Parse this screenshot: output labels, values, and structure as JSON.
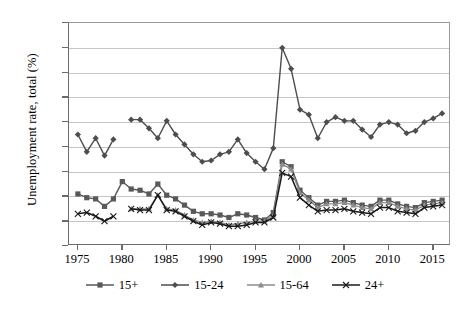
{
  "chart_data": {
    "type": "line",
    "title": "",
    "xlabel": "",
    "ylabel": "Unemployment rate, total (%)",
    "xlim": [
      1974,
      2017
    ],
    "ylim": [
      0,
      18
    ],
    "ytick_step": 2,
    "grid": true,
    "legend_position": "bottom",
    "ytick_labels": [
      "0",
      "2",
      "4",
      "6",
      "8",
      "10",
      "12",
      "14",
      "16",
      "18"
    ],
    "xtick_labels": [
      "1975",
      "1980",
      "1985",
      "1990",
      "1995",
      "2000",
      "2005",
      "2010",
      "2015"
    ],
    "xticks": [
      1975,
      1980,
      1985,
      1990,
      1995,
      2000,
      2005,
      2010,
      2015
    ],
    "series": [
      {
        "name": "15+",
        "marker": "square",
        "color": "#595959",
        "points": [
          {
            "x": 1975,
            "y": 4.2
          },
          {
            "x": 1976,
            "y": 3.9
          },
          {
            "x": 1977,
            "y": 3.8
          },
          {
            "x": 1978,
            "y": 3.2
          },
          {
            "x": 1979,
            "y": 3.8
          },
          {
            "x": 1980,
            "y": 5.2
          },
          {
            "x": 1981,
            "y": 4.6
          },
          {
            "x": 1982,
            "y": 4.5
          },
          {
            "x": 1983,
            "y": 4.2
          },
          {
            "x": 1984,
            "y": 5.0
          },
          {
            "x": 1985,
            "y": 4.1
          },
          {
            "x": 1986,
            "y": 3.8
          },
          {
            "x": 1987,
            "y": 3.3
          },
          {
            "x": 1988,
            "y": 2.8
          },
          {
            "x": 1989,
            "y": 2.6
          },
          {
            "x": 1990,
            "y": 2.6
          },
          {
            "x": 1991,
            "y": 2.5
          },
          {
            "x": 1992,
            "y": 2.3
          },
          {
            "x": 1993,
            "y": 2.6
          },
          {
            "x": 1994,
            "y": 2.5
          },
          {
            "x": 1995,
            "y": 2.3
          },
          {
            "x": 1996,
            "y": 2.1
          },
          {
            "x": 1997,
            "y": 2.7
          },
          {
            "x": 1998,
            "y": 6.8
          },
          {
            "x": 1999,
            "y": 6.4
          },
          {
            "x": 2000,
            "y": 4.5
          },
          {
            "x": 2001,
            "y": 3.9
          },
          {
            "x": 2002,
            "y": 3.3
          },
          {
            "x": 2003,
            "y": 3.6
          },
          {
            "x": 2004,
            "y": 3.6
          },
          {
            "x": 2005,
            "y": 3.7
          },
          {
            "x": 2006,
            "y": 3.5
          },
          {
            "x": 2007,
            "y": 3.3
          },
          {
            "x": 2008,
            "y": 3.2
          },
          {
            "x": 2009,
            "y": 3.7
          },
          {
            "x": 2010,
            "y": 3.7
          },
          {
            "x": 2011,
            "y": 3.4
          },
          {
            "x": 2012,
            "y": 3.2
          },
          {
            "x": 2013,
            "y": 3.1
          },
          {
            "x": 2014,
            "y": 3.5
          },
          {
            "x": 2015,
            "y": 3.6
          },
          {
            "x": 2016,
            "y": 3.7
          }
        ]
      },
      {
        "name": "15-24",
        "marker": "diamond",
        "color": "#4d4d4d",
        "points": [
          {
            "x": 1975,
            "y": 9.0
          },
          {
            "x": 1976,
            "y": 7.6
          },
          {
            "x": 1977,
            "y": 8.7
          },
          {
            "x": 1978,
            "y": 7.3
          },
          {
            "x": 1979,
            "y": 8.6
          },
          {
            "x": 1981,
            "y": 10.2
          },
          {
            "x": 1982,
            "y": 10.2
          },
          {
            "x": 1983,
            "y": 9.5
          },
          {
            "x": 1984,
            "y": 8.7
          },
          {
            "x": 1985,
            "y": 10.1
          },
          {
            "x": 1986,
            "y": 9.0
          },
          {
            "x": 1987,
            "y": 8.2
          },
          {
            "x": 1988,
            "y": 7.4
          },
          {
            "x": 1989,
            "y": 6.8
          },
          {
            "x": 1990,
            "y": 6.9
          },
          {
            "x": 1991,
            "y": 7.4
          },
          {
            "x": 1992,
            "y": 7.6
          },
          {
            "x": 1993,
            "y": 8.6
          },
          {
            "x": 1994,
            "y": 7.5
          },
          {
            "x": 1995,
            "y": 6.8
          },
          {
            "x": 1996,
            "y": 6.2
          },
          {
            "x": 1997,
            "y": 7.9
          },
          {
            "x": 1998,
            "y": 16.0
          },
          {
            "x": 1999,
            "y": 14.3
          },
          {
            "x": 2000,
            "y": 11.0
          },
          {
            "x": 2001,
            "y": 10.6
          },
          {
            "x": 2002,
            "y": 8.7
          },
          {
            "x": 2003,
            "y": 10.0
          },
          {
            "x": 2004,
            "y": 10.4
          },
          {
            "x": 2005,
            "y": 10.1
          },
          {
            "x": 2006,
            "y": 10.1
          },
          {
            "x": 2007,
            "y": 9.4
          },
          {
            "x": 2008,
            "y": 8.8
          },
          {
            "x": 2009,
            "y": 9.8
          },
          {
            "x": 2010,
            "y": 10.0
          },
          {
            "x": 2011,
            "y": 9.8
          },
          {
            "x": 2012,
            "y": 9.1
          },
          {
            "x": 2013,
            "y": 9.3
          },
          {
            "x": 2014,
            "y": 10.0
          },
          {
            "x": 2015,
            "y": 10.3
          },
          {
            "x": 2016,
            "y": 10.7
          }
        ]
      },
      {
        "name": "15-64",
        "marker": "triangle",
        "color": "#8c8c8c",
        "points": [
          {
            "x": 1981,
            "y": 3.0
          },
          {
            "x": 1982,
            "y": 3.0
          },
          {
            "x": 1983,
            "y": 3.0
          },
          {
            "x": 1984,
            "y": 4.1
          },
          {
            "x": 1985,
            "y": 3.0
          },
          {
            "x": 1986,
            "y": 2.9
          },
          {
            "x": 1987,
            "y": 2.5
          },
          {
            "x": 1988,
            "y": 2.1
          },
          {
            "x": 1989,
            "y": 1.9
          },
          {
            "x": 1990,
            "y": 2.0
          },
          {
            "x": 1991,
            "y": 1.9
          },
          {
            "x": 1992,
            "y": 1.7
          },
          {
            "x": 1993,
            "y": 1.8
          },
          {
            "x": 1994,
            "y": 1.9
          },
          {
            "x": 1995,
            "y": 2.0
          },
          {
            "x": 1996,
            "y": 2.0
          },
          {
            "x": 1997,
            "y": 2.5
          },
          {
            "x": 1998,
            "y": 6.6
          },
          {
            "x": 1999,
            "y": 6.2
          },
          {
            "x": 2000,
            "y": 4.3
          },
          {
            "x": 2001,
            "y": 3.7
          },
          {
            "x": 2002,
            "y": 3.1
          },
          {
            "x": 2003,
            "y": 3.4
          },
          {
            "x": 2004,
            "y": 3.4
          },
          {
            "x": 2005,
            "y": 3.5
          },
          {
            "x": 2006,
            "y": 3.3
          },
          {
            "x": 2007,
            "y": 3.1
          },
          {
            "x": 2008,
            "y": 3.0
          },
          {
            "x": 2009,
            "y": 3.5
          },
          {
            "x": 2010,
            "y": 3.5
          },
          {
            "x": 2011,
            "y": 3.2
          },
          {
            "x": 2012,
            "y": 3.0
          },
          {
            "x": 2013,
            "y": 2.9
          },
          {
            "x": 2014,
            "y": 3.3
          },
          {
            "x": 2015,
            "y": 3.4
          },
          {
            "x": 2016,
            "y": 3.5
          }
        ]
      },
      {
        "name": "24+",
        "marker": "cross",
        "color": "#1a1a1a",
        "points": [
          {
            "x": 1975,
            "y": 2.6
          },
          {
            "x": 1976,
            "y": 2.7
          },
          {
            "x": 1977,
            "y": 2.4
          },
          {
            "x": 1978,
            "y": 2.0
          },
          {
            "x": 1979,
            "y": 2.4
          },
          {
            "x": 1981,
            "y": 3.0
          },
          {
            "x": 1982,
            "y": 2.9
          },
          {
            "x": 1983,
            "y": 2.9
          },
          {
            "x": 1984,
            "y": 4.1
          },
          {
            "x": 1985,
            "y": 2.9
          },
          {
            "x": 1986,
            "y": 2.8
          },
          {
            "x": 1987,
            "y": 2.4
          },
          {
            "x": 1988,
            "y": 2.0
          },
          {
            "x": 1989,
            "y": 1.7
          },
          {
            "x": 1990,
            "y": 1.9
          },
          {
            "x": 1991,
            "y": 1.8
          },
          {
            "x": 1992,
            "y": 1.6
          },
          {
            "x": 1993,
            "y": 1.6
          },
          {
            "x": 1994,
            "y": 1.7
          },
          {
            "x": 1995,
            "y": 1.9
          },
          {
            "x": 1996,
            "y": 1.9
          },
          {
            "x": 1997,
            "y": 2.3
          },
          {
            "x": 1998,
            "y": 5.9
          },
          {
            "x": 1999,
            "y": 5.6
          },
          {
            "x": 2000,
            "y": 3.9
          },
          {
            "x": 2001,
            "y": 3.3
          },
          {
            "x": 2002,
            "y": 2.8
          },
          {
            "x": 2003,
            "y": 2.9
          },
          {
            "x": 2004,
            "y": 2.9
          },
          {
            "x": 2005,
            "y": 3.0
          },
          {
            "x": 2006,
            "y": 2.8
          },
          {
            "x": 2007,
            "y": 2.7
          },
          {
            "x": 2008,
            "y": 2.6
          },
          {
            "x": 2009,
            "y": 3.1
          },
          {
            "x": 2010,
            "y": 3.1
          },
          {
            "x": 2011,
            "y": 2.8
          },
          {
            "x": 2012,
            "y": 2.7
          },
          {
            "x": 2013,
            "y": 2.6
          },
          {
            "x": 2014,
            "y": 3.1
          },
          {
            "x": 2015,
            "y": 3.2
          },
          {
            "x": 2016,
            "y": 3.3
          }
        ]
      }
    ]
  }
}
